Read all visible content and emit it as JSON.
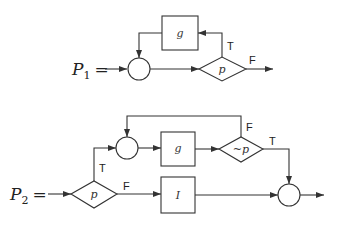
{
  "diagram_1": {
    "program_symbol": "P",
    "program_subscript": "1",
    "equals": "=",
    "join_node": "circle",
    "process_box": {
      "label": "g"
    },
    "decision": {
      "label": "p",
      "true_label": "T",
      "false_label": "F"
    }
  },
  "diagram_2": {
    "program_symbol": "P",
    "program_subscript": "2",
    "equals": "=",
    "entry_decision": {
      "label": "p",
      "true_label": "T",
      "false_label": "F"
    },
    "loop_join_node": "circle",
    "loop_box": {
      "label": "g"
    },
    "loop_decision": {
      "label": "~p",
      "true_label": "T",
      "false_label": "F"
    },
    "else_box": {
      "label": "I"
    },
    "exit_join_node": "circle"
  },
  "colors": {
    "stroke": "#333333",
    "background": "#ffffff"
  }
}
